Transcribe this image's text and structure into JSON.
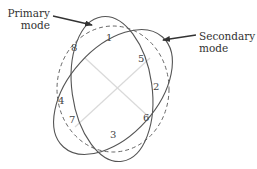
{
  "labels": {
    "primary": "Primary mode",
    "primary_line1": "Primary",
    "primary_line2": "mode",
    "secondary": "Secondary mode",
    "secondary_line1": "Secondary",
    "secondary_line2": "mode"
  },
  "points": [
    {
      "id": "1",
      "x": 110,
      "y": 37
    },
    {
      "id": "2",
      "x": 155,
      "y": 84
    },
    {
      "id": "3",
      "x": 112,
      "y": 130
    },
    {
      "id": "4",
      "x": 60,
      "y": 100
    },
    {
      "id": "5",
      "x": 137,
      "y": 50
    },
    {
      "id": "6",
      "x": 144,
      "y": 113
    },
    {
      "id": "7",
      "x": 70,
      "y": 117
    },
    {
      "id": "8",
      "x": 71,
      "y": 44
    }
  ],
  "colors": {
    "stroke": "#555555",
    "dashed": "#666666",
    "cross": "#d8d8d8",
    "text": "#333333"
  }
}
